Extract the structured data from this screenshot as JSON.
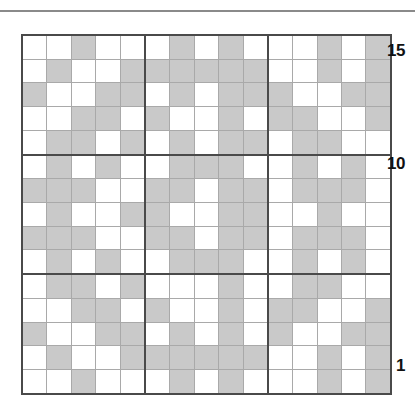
{
  "figure": {
    "type": "grid-diagram",
    "rows": 15,
    "cols": 15,
    "filled_color": "#c9c9c9",
    "empty_color": "#ffffff",
    "grid_line_color": "#a9a9a9",
    "block_line_color": "#4a4a4a"
  },
  "axis": {
    "y_labels": [
      {
        "value": "15",
        "row": 15
      },
      {
        "value": "10",
        "row": 10
      },
      {
        "value": "1",
        "row": 1
      }
    ]
  },
  "chart_data": {
    "type": "heatmap",
    "title": "",
    "xlabel": "",
    "ylabel": "",
    "grid": true,
    "legend": "none",
    "categories_x": [
      1,
      2,
      3,
      4,
      5,
      6,
      7,
      8,
      9,
      10,
      11,
      12,
      13,
      14,
      15
    ],
    "categories_y": [
      15,
      14,
      13,
      12,
      11,
      10,
      9,
      8,
      7,
      6,
      5,
      4,
      3,
      2,
      1
    ],
    "value_map": {
      "0": "empty",
      "1": "shaded"
    },
    "rows_top_to_bottom": [
      {
        "row": 15,
        "values": [
          0,
          0,
          1,
          0,
          0,
          0,
          1,
          0,
          1,
          0,
          0,
          0,
          1,
          0,
          1
        ]
      },
      {
        "row": 14,
        "values": [
          0,
          1,
          0,
          0,
          1,
          1,
          1,
          1,
          1,
          1,
          0,
          0,
          1,
          0,
          1
        ]
      },
      {
        "row": 13,
        "values": [
          1,
          0,
          0,
          1,
          1,
          0,
          1,
          0,
          1,
          1,
          1,
          0,
          0,
          1,
          1
        ]
      },
      {
        "row": 12,
        "values": [
          0,
          0,
          1,
          1,
          0,
          1,
          0,
          0,
          1,
          0,
          1,
          1,
          0,
          0,
          1
        ]
      },
      {
        "row": 11,
        "values": [
          0,
          1,
          1,
          0,
          1,
          0,
          1,
          0,
          1,
          1,
          0,
          1,
          1,
          0,
          0
        ]
      },
      {
        "row": 10,
        "values": [
          0,
          1,
          0,
          1,
          0,
          0,
          1,
          1,
          1,
          0,
          0,
          1,
          0,
          1,
          0
        ]
      },
      {
        "row": 9,
        "values": [
          1,
          1,
          1,
          0,
          0,
          1,
          1,
          0,
          1,
          1,
          0,
          1,
          1,
          1,
          0
        ]
      },
      {
        "row": 8,
        "values": [
          0,
          1,
          0,
          0,
          1,
          1,
          0,
          0,
          1,
          1,
          0,
          0,
          1,
          0,
          0
        ]
      },
      {
        "row": 7,
        "values": [
          1,
          1,
          1,
          0,
          0,
          1,
          1,
          0,
          1,
          1,
          0,
          1,
          1,
          1,
          0
        ]
      },
      {
        "row": 6,
        "values": [
          0,
          1,
          0,
          1,
          0,
          0,
          1,
          1,
          1,
          0,
          0,
          1,
          0,
          1,
          0
        ]
      },
      {
        "row": 5,
        "values": [
          0,
          1,
          1,
          0,
          1,
          0,
          0,
          0,
          1,
          0,
          0,
          1,
          1,
          0,
          0
        ]
      },
      {
        "row": 4,
        "values": [
          0,
          0,
          1,
          1,
          0,
          1,
          0,
          0,
          1,
          0,
          1,
          1,
          0,
          0,
          1
        ]
      },
      {
        "row": 3,
        "values": [
          1,
          0,
          0,
          1,
          1,
          0,
          1,
          0,
          1,
          0,
          1,
          0,
          0,
          1,
          1
        ]
      },
      {
        "row": 2,
        "values": [
          0,
          1,
          0,
          0,
          1,
          1,
          1,
          1,
          1,
          1,
          0,
          0,
          1,
          0,
          1
        ]
      },
      {
        "row": 1,
        "values": [
          0,
          0,
          1,
          0,
          0,
          0,
          1,
          0,
          1,
          0,
          0,
          0,
          1,
          0,
          1
        ]
      }
    ]
  }
}
